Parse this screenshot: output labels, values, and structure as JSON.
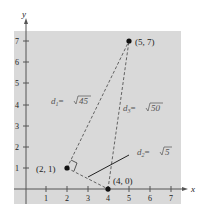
{
  "axes": {
    "x_label": "x",
    "y_label": "y",
    "x_ticks": [
      "1",
      "2",
      "3",
      "4",
      "5",
      "6",
      "7"
    ],
    "y_ticks": [
      "1",
      "2",
      "3",
      "4",
      "5",
      "6",
      "7"
    ]
  },
  "points": [
    {
      "label": "(5, 7)",
      "x": 5,
      "y": 7
    },
    {
      "label": "(2, 1)",
      "x": 2,
      "y": 1
    },
    {
      "label": "(4, 0)",
      "x": 4,
      "y": 0
    }
  ],
  "distances": {
    "d1": {
      "name": "d",
      "sub": "1",
      "eq": "=",
      "value": "45"
    },
    "d2": {
      "name": "d",
      "sub": "2",
      "eq": "=",
      "value": "5"
    },
    "d3": {
      "name": "d",
      "sub": "3",
      "eq": "=",
      "value": "50"
    }
  },
  "colors": {
    "background": "#d9d9d9",
    "axis": "#555555",
    "dashed": "#555555",
    "point": "#111111"
  }
}
